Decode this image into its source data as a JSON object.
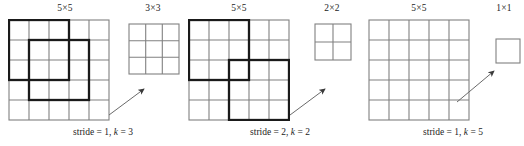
{
  "figure": {
    "type": "convolution-stride-kernel-diagram",
    "colors": {
      "grid_line": "#808080",
      "kernel_outline": "#1a1a1a",
      "arrow": "#555555",
      "text": "#1d1d1d",
      "background": "#ffffff"
    }
  },
  "panels": [
    {
      "id": "panel-1",
      "input_label": "5×5",
      "output_label": "3×3",
      "caption_prefix": "stride = 1, ",
      "caption_var": "k",
      "caption_suffix": " = 3",
      "caption_full": "stride = 1, k = 3",
      "stride": 1,
      "kernel": 3,
      "input_size": 5,
      "output_size": 3,
      "windows": [
        {
          "name": "kernel-window-1",
          "row": 0,
          "col": 0,
          "size": 3
        },
        {
          "name": "kernel-window-2",
          "row": 1,
          "col": 1,
          "size": 3
        }
      ]
    },
    {
      "id": "panel-2",
      "input_label": "5×5",
      "output_label": "2×2",
      "caption_prefix": "stride = 2, ",
      "caption_var": "k",
      "caption_suffix": " = 2",
      "caption_full": "stride = 2, k = 2",
      "stride": 2,
      "kernel": 3,
      "input_size": 5,
      "output_size": 2,
      "windows": [
        {
          "name": "kernel-window-1",
          "row": 0,
          "col": 0,
          "size": 3
        },
        {
          "name": "kernel-window-2",
          "row": 2,
          "col": 2,
          "size": 3
        }
      ]
    },
    {
      "id": "panel-3",
      "input_label": "5×5",
      "output_label": "1×1",
      "caption_prefix": "stride = 1, ",
      "caption_var": "k",
      "caption_suffix": " = 5",
      "caption_full": "stride = 1, k = 5",
      "stride": 1,
      "kernel": 5,
      "input_size": 5,
      "output_size": 1,
      "windows": []
    }
  ]
}
